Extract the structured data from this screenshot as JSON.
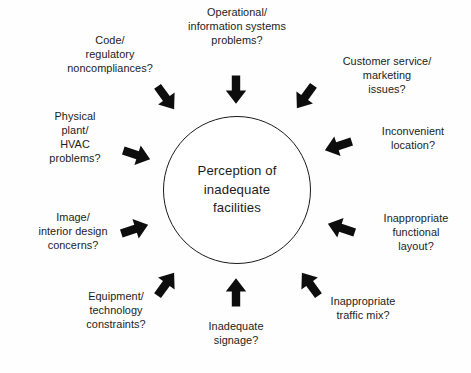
{
  "diagram": {
    "type": "radial-convergence",
    "center": {
      "label": "Perception of\ninadequate\nfacilities",
      "shape": "circle"
    },
    "arrow_color": "#0d0d0d",
    "text_color": "#1c1c1c",
    "background_color": "#ffffff",
    "nodes": [
      {
        "id": "operational",
        "label": "Operational/\ninformation systems\nproblems?",
        "angle_deg": 90,
        "arrow_direction": "down"
      },
      {
        "id": "customer-service",
        "label": "Customer service/\nmarketing\nissues?",
        "angle_deg": 54,
        "arrow_direction": "down-left"
      },
      {
        "id": "inconvenient-location",
        "label": "Inconvenient\nlocation?",
        "angle_deg": 18,
        "arrow_direction": "left-down"
      },
      {
        "id": "functional-layout",
        "label": "Inappropriate\nfunctional\nlayout?",
        "angle_deg": -18,
        "arrow_direction": "left-up"
      },
      {
        "id": "traffic-mix",
        "label": "Inappropriate\ntraffic mix?",
        "angle_deg": -54,
        "arrow_direction": "up-left"
      },
      {
        "id": "signage",
        "label": "Inadequate\nsignage?",
        "angle_deg": -90,
        "arrow_direction": "up"
      },
      {
        "id": "equipment-technology",
        "label": "Equipment/\ntechnology\nconstraints?",
        "angle_deg": -126,
        "arrow_direction": "up-right"
      },
      {
        "id": "image-interior-design",
        "label": "Image/\ninterior design\nconcerns?",
        "angle_deg": -162,
        "arrow_direction": "right-up"
      },
      {
        "id": "physical-plant",
        "label": "Physical\nplant/\nHVAC\nproblems?",
        "angle_deg": 162,
        "arrow_direction": "right-down"
      },
      {
        "id": "code-regulatory",
        "label": "Code/\nregulatory\nnoncompliances?",
        "angle_deg": 126,
        "arrow_direction": "down-right"
      }
    ]
  }
}
